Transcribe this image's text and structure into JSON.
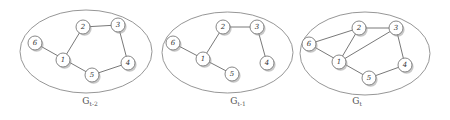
{
  "diagram": {
    "colors": {
      "background": "#ffffff",
      "ellipse_stroke": "#8a8a8a",
      "edge_stroke": "#555555",
      "node_fill": "#ffffff",
      "node_stroke": "#6a6a6a",
      "text": "#333333"
    },
    "graphs": [
      {
        "label_main": "G",
        "label_sub": "t-2",
        "ellipse": {
          "cx": 86,
          "cy": 51.5,
          "rx": 66,
          "ry": 41.5
        },
        "label_pos": {
          "x": 90,
          "y": 104
        },
        "nodes": [
          {
            "id": "1",
            "label": "1",
            "x": 63,
            "y": 60
          },
          {
            "id": "2",
            "label": "2",
            "x": 83,
            "y": 27
          },
          {
            "id": "3",
            "label": "3",
            "x": 118,
            "y": 25
          },
          {
            "id": "4",
            "label": "4",
            "x": 128,
            "y": 63
          },
          {
            "id": "5",
            "label": "5",
            "x": 92,
            "y": 75
          },
          {
            "id": "6",
            "label": "6",
            "x": 35,
            "y": 43
          }
        ],
        "edges": [
          [
            "6",
            "5"
          ],
          [
            "1",
            "2"
          ],
          [
            "2",
            "3"
          ],
          [
            "3",
            "4"
          ],
          [
            "4",
            "5"
          ]
        ]
      },
      {
        "label_main": "G",
        "label_sub": "t-1",
        "ellipse": {
          "cx": 227.5,
          "cy": 52.5,
          "rx": 65.5,
          "ry": 40.5
        },
        "label_pos": {
          "x": 238,
          "y": 104
        },
        "nodes": [
          {
            "id": "1",
            "label": "1",
            "x": 203,
            "y": 59
          },
          {
            "id": "2",
            "label": "2",
            "x": 223,
            "y": 27
          },
          {
            "id": "3",
            "label": "3",
            "x": 257,
            "y": 27
          },
          {
            "id": "4",
            "label": "4",
            "x": 267,
            "y": 63
          },
          {
            "id": "5",
            "label": "5",
            "x": 232,
            "y": 74
          },
          {
            "id": "6",
            "label": "6",
            "x": 173,
            "y": 43
          }
        ],
        "edges": [
          [
            "6",
            "5"
          ],
          [
            "1",
            "2"
          ],
          [
            "2",
            "3"
          ],
          [
            "3",
            "4"
          ]
        ]
      },
      {
        "label_main": "G",
        "label_sub": "t",
        "ellipse": {
          "cx": 365,
          "cy": 53.5,
          "rx": 65,
          "ry": 41.5
        },
        "label_pos": {
          "x": 357,
          "y": 104
        },
        "nodes": [
          {
            "id": "1",
            "label": "1",
            "x": 339,
            "y": 62
          },
          {
            "id": "2",
            "label": "2",
            "x": 359,
            "y": 28
          },
          {
            "id": "3",
            "label": "3",
            "x": 396,
            "y": 28
          },
          {
            "id": "4",
            "label": "4",
            "x": 405,
            "y": 65
          },
          {
            "id": "5",
            "label": "5",
            "x": 369,
            "y": 78
          },
          {
            "id": "6",
            "label": "6",
            "x": 309,
            "y": 44
          }
        ],
        "edges": [
          [
            "6",
            "5"
          ],
          [
            "6",
            "2"
          ],
          [
            "1",
            "2"
          ],
          [
            "1",
            "3"
          ],
          [
            "2",
            "3"
          ],
          [
            "3",
            "4"
          ],
          [
            "4",
            "5"
          ]
        ]
      }
    ]
  }
}
